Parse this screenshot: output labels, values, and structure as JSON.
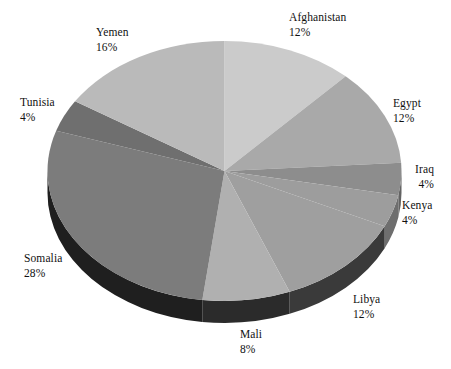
{
  "chart_data": {
    "type": "pie",
    "title": "",
    "subtitle": "",
    "xlabel": "",
    "ylabel": "",
    "legend_position": "none",
    "grid": false,
    "three_d": true,
    "start_angle_deg": 0,
    "direction": "clockwise",
    "value_unit": "percent",
    "total": 100,
    "categories": [
      "Afghanistan",
      "Egypt",
      "Iraq",
      "Kenya",
      "Libya",
      "Mali",
      "Somalia",
      "Tunisia",
      "Yemen"
    ],
    "values": [
      12,
      12,
      4,
      4,
      12,
      8,
      28,
      4,
      16
    ],
    "labels": [
      "12%",
      "12%",
      "4%",
      "4%",
      "12%",
      "8%",
      "28%",
      "4%",
      "16%"
    ],
    "slices": [
      {
        "name": "Afghanistan",
        "value": 12,
        "label": "12%",
        "color": "#cbcbcb",
        "side_color": "#8e8e8e"
      },
      {
        "name": "Egypt",
        "value": 12,
        "label": "12%",
        "color": "#a9a9a9",
        "side_color": "#767676"
      },
      {
        "name": "Iraq",
        "value": 4,
        "label": "4%",
        "color": "#8d8d8d",
        "side_color": "#636363"
      },
      {
        "name": "Kenya",
        "value": 4,
        "label": "4%",
        "color": "#9d9d9d",
        "side_color": "#6e6e6e"
      },
      {
        "name": "Libya",
        "value": 12,
        "label": "12%",
        "color": "#9f9f9f",
        "side_color": "#3a3a3a"
      },
      {
        "name": "Mali",
        "value": 8,
        "label": "8%",
        "color": "#b0b0b0",
        "side_color": "#2b2b2b"
      },
      {
        "name": "Somalia",
        "value": 28,
        "label": "28%",
        "color": "#7c7c7c",
        "side_color": "#1f1f1f"
      },
      {
        "name": "Tunisia",
        "value": 4,
        "label": "4%",
        "color": "#6f6f6f",
        "side_color": "#4a4a4a"
      },
      {
        "name": "Yemen",
        "value": 16,
        "label": "16%",
        "color": "#bababa",
        "side_color": "#868686"
      }
    ]
  },
  "labels": {
    "afghanistan": {
      "name": "Afghanistan",
      "pct": "12%"
    },
    "egypt": {
      "name": "Egypt",
      "pct": "12%"
    },
    "iraq": {
      "name": "Iraq",
      "pct": "4%"
    },
    "kenya": {
      "name": "Kenya",
      "pct": "4%"
    },
    "libya": {
      "name": "Libya",
      "pct": "12%"
    },
    "mali": {
      "name": "Mali",
      "pct": "8%"
    },
    "somalia": {
      "name": "Somalia",
      "pct": "28%"
    },
    "tunisia": {
      "name": "Tunisia",
      "pct": "4%"
    },
    "yemen": {
      "name": "Yemen",
      "pct": "16%"
    }
  },
  "colors": {
    "background": "#ffffff",
    "text": "#111111",
    "outline": "#9a9a9a"
  }
}
